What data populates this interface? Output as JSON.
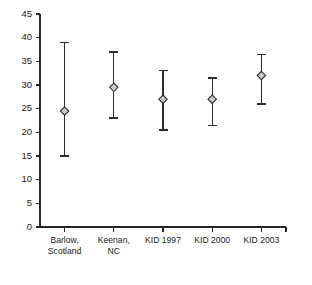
{
  "chart_data": {
    "type": "scatter",
    "title": "",
    "subtitle": "",
    "xlabel": "",
    "ylabel": "",
    "ylim": [
      0,
      45
    ],
    "yticks": [
      0,
      5,
      10,
      15,
      20,
      25,
      30,
      35,
      40,
      45
    ],
    "ytick_labels": [
      "0",
      "5",
      "10",
      "15",
      "20",
      "25",
      "30",
      "35",
      "40",
      "45"
    ],
    "grid": false,
    "legend": false,
    "legend_position": "none",
    "marker": "diamond",
    "error_bars": "vertical",
    "categories": [
      "Barlow, Scotland",
      "Keenan, NC",
      "KID 1997",
      "KID 2000",
      "KID 2003"
    ],
    "category_label_lines": [
      [
        "Barlow,",
        "Scotland"
      ],
      [
        "Keenan,",
        "NC"
      ],
      [
        "KID 1997"
      ],
      [
        "KID 2000"
      ],
      [
        "KID 2003"
      ]
    ],
    "values": [
      24.5,
      29.5,
      27.0,
      27.0,
      32.0
    ],
    "error_low": [
      15.0,
      23.0,
      20.5,
      21.5,
      26.0
    ],
    "error_high": [
      39.0,
      37.0,
      33.0,
      31.5,
      36.5
    ],
    "series": [
      {
        "name": "Estimate with 95% CI",
        "points": [
          {
            "category": "Barlow, Scotland",
            "value": 24.5,
            "low": 15.0,
            "high": 39.0
          },
          {
            "category": "Keenan, NC",
            "value": 29.5,
            "low": 23.0,
            "high": 37.0
          },
          {
            "category": "KID 1997",
            "value": 27.0,
            "low": 20.5,
            "high": 33.0
          },
          {
            "category": "KID 2000",
            "value": 27.0,
            "low": 21.5,
            "high": 31.5
          },
          {
            "category": "KID 2003",
            "value": 32.0,
            "low": 26.0,
            "high": 36.5
          }
        ]
      }
    ],
    "colors": {
      "axis": "#262626",
      "error_bar": "#2b2b2b",
      "marker_fill": "#c8c8c8",
      "marker_stroke": "#2b2b2b",
      "background": "#ffffff"
    }
  }
}
